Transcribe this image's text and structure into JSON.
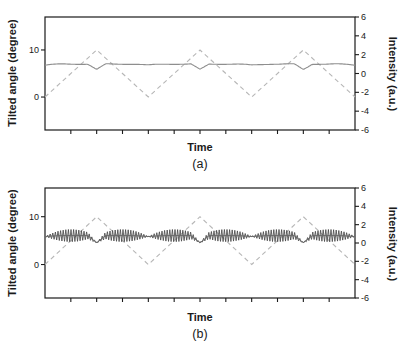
{
  "figure": {
    "background": "#ffffff"
  },
  "colors": {
    "axis": "#1a1a1a",
    "text": "#1a1a1a",
    "triangle_dashed": "#b6b6b6",
    "response_line_a": "#8e8e8e",
    "band_fill_b": "#4a4a4a",
    "band_centerline_b": "#6a6a6a"
  },
  "chart_data": [
    {
      "type": "line",
      "panel": "a",
      "caption": "(a)",
      "xlabel": "Time",
      "ylabel_left": "Tilted angle (degree)",
      "ylabel_right": "Intensity (a.u.)",
      "x_axis": {
        "range": [
          0,
          310
        ],
        "minor_tick_count": 11,
        "tick_labels": []
      },
      "left_axis": {
        "ticks": [
          10,
          0
        ],
        "labels": [
          "10",
          "0"
        ],
        "range": [
          -7,
          17
        ],
        "unit": "degree"
      },
      "right_axis": {
        "ticks": [
          6,
          4,
          2,
          0,
          -2,
          -4,
          -6
        ],
        "labels": [
          "6",
          "4",
          "2",
          "0",
          "-2",
          "-4",
          "-6"
        ],
        "range": [
          -6,
          6
        ],
        "unit": "a.u."
      },
      "grid": false,
      "legend": "none",
      "series": [
        {
          "name": "tilt-drive-triangle",
          "style": "dashed",
          "color": "#b6b6b6",
          "waveform": "triangle",
          "min": 0,
          "max": 10,
          "cycles": 3,
          "start": "rising-from-min"
        },
        {
          "name": "intensity-response",
          "style": "solid",
          "color": "#8e8e8e",
          "baseline": 7.0,
          "dip_depth": 1.15,
          "dip_half_width": 9,
          "trough_sag": 0.22,
          "ripple_amp": 0.07
        }
      ]
    },
    {
      "type": "line",
      "panel": "b",
      "caption": "(b)",
      "xlabel": "Time",
      "ylabel_left": "Tilted angle (degree)",
      "ylabel_right": "Intensity (a.u.)",
      "x_axis": {
        "range": [
          0,
          310
        ],
        "minor_tick_count": 11,
        "tick_labels": []
      },
      "left_axis": {
        "ticks": [
          10,
          0
        ],
        "labels": [
          "10",
          "0"
        ],
        "range": [
          -7,
          16
        ],
        "unit": "degree"
      },
      "right_axis": {
        "ticks": [
          6,
          4,
          2,
          0,
          -2,
          -4,
          -6
        ],
        "labels": [
          "6",
          "4",
          "2",
          "0",
          "-2",
          "-4",
          "-6"
        ],
        "range": [
          -6,
          6
        ],
        "unit": "a.u."
      },
      "grid": false,
      "legend": "none",
      "series": [
        {
          "name": "tilt-drive-triangle",
          "style": "dashed",
          "color": "#b6b6b6",
          "waveform": "triangle",
          "min": 0,
          "max": 10,
          "cycles": 3,
          "start": "rising-from-min"
        },
        {
          "name": "oscillating-intensity-band",
          "style": "oscillation-band",
          "color": "#6a6a6a",
          "band_color": "#4a4a4a",
          "baseline": 6.05,
          "dip_depth": 1.5,
          "dip_half_width": 9,
          "trough_sag": 0.2,
          "ripple_amp": 0,
          "envelope_max": 1.28,
          "envelope_exponent": 0.9,
          "envelope_zero_points": "at every triangle peak and trough"
        }
      ]
    }
  ]
}
